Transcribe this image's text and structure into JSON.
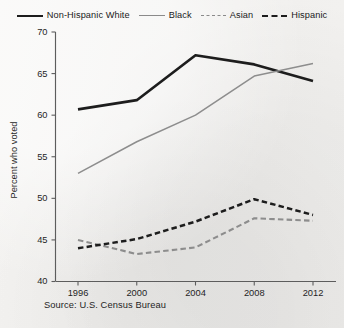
{
  "legend": {
    "items": [
      {
        "label": "Non-Hispanic White",
        "style": "solid-thick-black",
        "color": "#1d1d1d"
      },
      {
        "label": "Black",
        "style": "solid-thin-gray",
        "color": "#8a8a8a"
      },
      {
        "label": "Asian",
        "style": "dashed-gray",
        "color": "#8a8a8a"
      },
      {
        "label": "Hispanic",
        "style": "dashed-black",
        "color": "#1d1d1d"
      }
    ]
  },
  "source": {
    "text": "Source: U.S. Census Bureau"
  },
  "chart_data": {
    "type": "line",
    "title": "",
    "xlabel": "",
    "ylabel": "Percent who voted",
    "x": [
      1996,
      2000,
      2004,
      2008,
      2012
    ],
    "xtick_labels": [
      "1996",
      "2000",
      "2004",
      "2008",
      "2012"
    ],
    "ytick_labels": [
      "40",
      "45",
      "50",
      "55",
      "60",
      "65",
      "70"
    ],
    "yticks": [
      40,
      45,
      50,
      55,
      60,
      65,
      70
    ],
    "ylim": [
      40,
      70
    ],
    "grid": false,
    "legend_position": "top",
    "series": [
      {
        "name": "Non-Hispanic White",
        "color": "#1d1d1d",
        "style": "solid",
        "width": 2.7,
        "values": [
          60.7,
          61.8,
          67.2,
          66.1,
          64.1
        ]
      },
      {
        "name": "Black",
        "color": "#8d8d8d",
        "style": "solid",
        "width": 1.5,
        "values": [
          53.0,
          56.8,
          60.0,
          64.7,
          66.2
        ]
      },
      {
        "name": "Asian",
        "color": "#8d8d8d",
        "style": "dashed",
        "width": 2.1,
        "values": [
          45.0,
          43.3,
          44.1,
          47.6,
          47.3
        ]
      },
      {
        "name": "Hispanic",
        "color": "#1d1d1d",
        "style": "dashed",
        "width": 2.5,
        "values": [
          44.0,
          45.1,
          47.2,
          49.9,
          48.0
        ]
      }
    ]
  }
}
